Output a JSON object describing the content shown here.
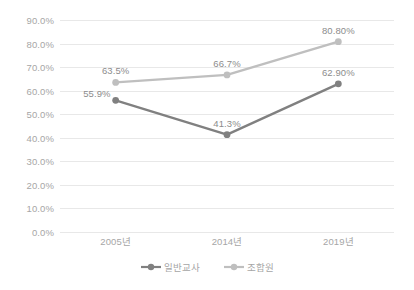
{
  "chart_data": {
    "type": "line",
    "title": "",
    "xlabel": "",
    "ylabel": "",
    "categories": [
      "2005년",
      "2014년",
      "2019년"
    ],
    "ylim": [
      0,
      90
    ],
    "ytick_labels": [
      "0.0%",
      "10.0%",
      "20.0%",
      "30.0%",
      "40.0%",
      "50.0%",
      "60.0%",
      "70.0%",
      "80.0%",
      "90.0%"
    ],
    "ytick_values": [
      0,
      10,
      20,
      30,
      40,
      50,
      60,
      70,
      80,
      90
    ],
    "grid": true,
    "legend_position": "bottom",
    "series": [
      {
        "name": "일반교사",
        "color": "#808080",
        "values": [
          55.9,
          41.3,
          62.9
        ],
        "labels": [
          "55.9%",
          "41.3%",
          "62.90%"
        ],
        "label_positions": [
          "left",
          "above",
          "above"
        ]
      },
      {
        "name": "조합원",
        "color": "#bfbfbf",
        "values": [
          63.5,
          66.7,
          80.8
        ],
        "labels": [
          "63.5%",
          "66.7%",
          "80.80%"
        ],
        "label_positions": [
          "above",
          "above",
          "above"
        ]
      }
    ]
  },
  "colors": {
    "background": "#ffffff",
    "gridline": "#e8e8e8",
    "axis_text": "#a6a6a6",
    "label_text": "#8c8c8c",
    "series_1": "#808080",
    "series_2": "#bfbfbf"
  }
}
